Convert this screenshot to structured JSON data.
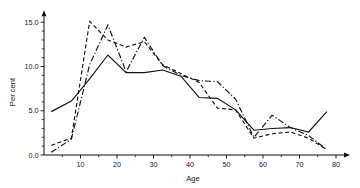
{
  "chart_data": {
    "type": "line",
    "title": "",
    "xlabel": "Age",
    "ylabel": "Per cent",
    "xlim": [
      0,
      80
    ],
    "ylim": [
      0,
      15.8
    ],
    "grid": false,
    "legend": "none",
    "x_ticks_major": [
      10,
      20,
      30,
      40,
      50,
      60,
      70,
      80
    ],
    "x_tick_labels": [
      "10",
      "20",
      "30",
      "40",
      "50",
      "60",
      "70",
      "80"
    ],
    "x_ticks_minor": [
      5,
      15,
      25,
      35,
      45,
      55,
      65,
      75
    ],
    "y_ticks_major": [
      0.0,
      5.0,
      10.0,
      15.0
    ],
    "y_tick_labels": [
      "0.0",
      "5.0",
      "10.0",
      "15.0"
    ],
    "y_ticks_minor": [
      1,
      2,
      3,
      4,
      6,
      7,
      8,
      9,
      11,
      12,
      13,
      14
    ],
    "series": [
      {
        "name": "series-solid",
        "style": "solid",
        "color": "#141414",
        "x": [
          2,
          7.5,
          12.5,
          17.5,
          22.5,
          27.5,
          32.5,
          37.5,
          42.5,
          47.5,
          52.5,
          57.5,
          62.5,
          67.5,
          72.5,
          77.5
        ],
        "values": [
          4.9,
          6.1,
          8.6,
          11.3,
          9.3,
          9.3,
          9.6,
          8.9,
          6.5,
          6.4,
          5.1,
          2.8,
          3.0,
          3.1,
          2.6,
          4.9
        ]
      },
      {
        "name": "series-dashed",
        "style": "dashed",
        "color": "#141414",
        "x": [
          2,
          7.5,
          12.5,
          17.5,
          22.5,
          27.5,
          32.5,
          37.5,
          42.5,
          47.5,
          52.5,
          57.5,
          62.5,
          67.5,
          72.5,
          77.5
        ],
        "values": [
          1.1,
          1.9,
          15.1,
          13.0,
          12.2,
          12.8,
          10.2,
          9.2,
          8.2,
          5.3,
          5.1,
          1.9,
          2.4,
          2.6,
          1.9,
          0.6
        ]
      },
      {
        "name": "series-dashdot",
        "style": "dashdot",
        "color": "#141414",
        "x": [
          2,
          7.5,
          12.5,
          17.5,
          22.5,
          27.5,
          32.5,
          37.5,
          42.5,
          47.5,
          52.5,
          57.5,
          62.5,
          67.5,
          72.5,
          77.5
        ],
        "values": [
          0.3,
          1.8,
          10.2,
          14.7,
          9.4,
          13.3,
          10.1,
          9.0,
          8.4,
          8.3,
          6.3,
          2.0,
          4.5,
          3.1,
          2.2,
          0.6
        ]
      }
    ]
  },
  "axes": {
    "y_label": "Per cent",
    "x_label": "Age"
  }
}
